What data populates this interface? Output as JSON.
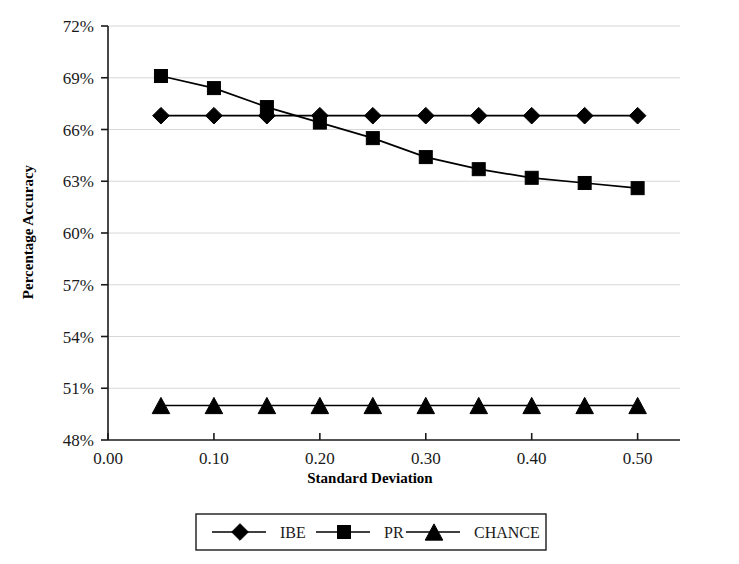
{
  "chart_data": {
    "type": "line",
    "title": "",
    "xlabel": "Standard Deviation",
    "ylabel": "Percentage Accuracy",
    "x": [
      0.05,
      0.1,
      0.15,
      0.2,
      0.25,
      0.3,
      0.35,
      0.4,
      0.45,
      0.5
    ],
    "xlim": [
      0.0,
      0.54
    ],
    "ylim": [
      48,
      72
    ],
    "xticks": [
      0.0,
      0.1,
      0.2,
      0.3,
      0.4,
      0.5
    ],
    "xtick_labels": [
      "0.00",
      "0.10",
      "0.20",
      "0.30",
      "0.40",
      "0.50"
    ],
    "yticks": [
      48,
      51,
      54,
      57,
      60,
      63,
      66,
      69,
      72
    ],
    "ytick_labels": [
      "48%",
      "51%",
      "54%",
      "57%",
      "60%",
      "63%",
      "66%",
      "69%",
      "72%"
    ],
    "grid": true,
    "grid_axis": "y",
    "legend_position": "bottom",
    "series": [
      {
        "name": "IBE",
        "marker": "diamond",
        "color": "#000000",
        "values": [
          66.8,
          66.8,
          66.8,
          66.8,
          66.8,
          66.8,
          66.8,
          66.8,
          66.8,
          66.8
        ]
      },
      {
        "name": "PR",
        "marker": "square",
        "color": "#000000",
        "values": [
          69.1,
          68.4,
          67.3,
          66.4,
          65.5,
          64.4,
          63.7,
          63.2,
          62.9,
          62.6
        ]
      },
      {
        "name": "CHANCE",
        "marker": "triangle",
        "color": "#000000",
        "values": [
          50.0,
          50.0,
          50.0,
          50.0,
          50.0,
          50.0,
          50.0,
          50.0,
          50.0,
          50.0
        ]
      }
    ]
  },
  "legend": {
    "entries": [
      {
        "label": "IBE",
        "marker": "diamond"
      },
      {
        "label": "PR",
        "marker": "square"
      },
      {
        "label": "CHANCE",
        "marker": "triangle"
      }
    ]
  }
}
